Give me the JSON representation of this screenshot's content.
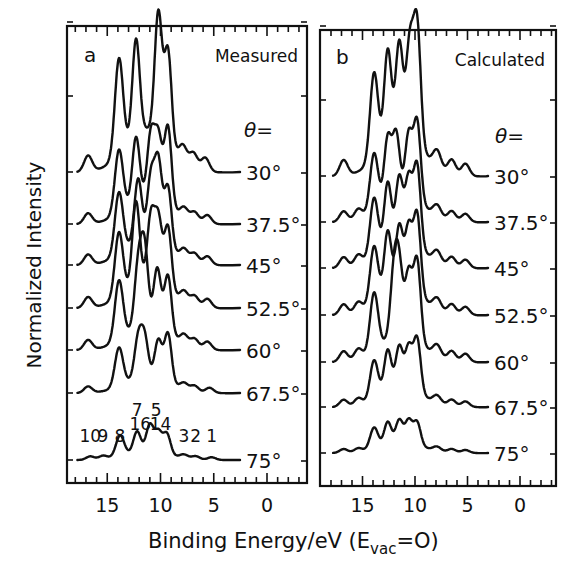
{
  "figure": {
    "ylabel": "Normalized Intensity",
    "xlabel_main": "Binding Energy/eV (E",
    "xlabel_sub": "vac",
    "xlabel_tail": "=O)",
    "theta_label": "θ="
  },
  "chart_data": {
    "type": "line",
    "xlabel": "Binding Energy/eV (E_vac=0)",
    "ylabel": "Normalized Intensity",
    "xlim": [
      18,
      -3
    ],
    "xticks": [
      15,
      10,
      5,
      0
    ],
    "xtick_labels": [
      "15",
      "10",
      "5",
      "0"
    ],
    "x_reversed": true,
    "grid": false,
    "offset_stacked": true,
    "angles": [
      "30°",
      "37.5°",
      "45°",
      "52.5°",
      "60°",
      "67.5°",
      "75°"
    ],
    "panels": [
      {
        "id": "a",
        "letter": "a",
        "title": "Measured",
        "peak_labels": [
          {
            "label": "10",
            "energy": 16.6
          },
          {
            "label": "9",
            "energy": 15.4
          },
          {
            "label": "8",
            "energy": 13.8
          },
          {
            "label": "7",
            "energy": 12.2
          },
          {
            "label": "16",
            "energy": 11.9
          },
          {
            "label": "5",
            "energy": 10.4
          },
          {
            "label": "14",
            "energy": 10.0
          },
          {
            "label": "3",
            "energy": 7.8
          },
          {
            "label": "2",
            "energy": 6.7
          },
          {
            "label": "1",
            "energy": 5.2
          }
        ],
        "series": [
          {
            "name": "30°",
            "peaks_eV": [
              16.8,
              13.9,
              12.3,
              10.2,
              9.3,
              7.9,
              6.9,
              5.8
            ],
            "max_peak_eV": 10.2
          },
          {
            "name": "37.5°",
            "peaks_eV": [
              16.8,
              13.9,
              12.3,
              10.9,
              10.2,
              9.3,
              7.8,
              6.8,
              5.6
            ],
            "max_peak_eV": 9.3
          },
          {
            "name": "45°",
            "peaks_eV": [
              16.8,
              13.9,
              12.1,
              10.9,
              10.2,
              9.3,
              7.8,
              6.8,
              5.6
            ],
            "max_peak_eV": 10.2
          },
          {
            "name": "52.5°",
            "peaks_eV": [
              16.8,
              13.9,
              12.3,
              10.9,
              10.2,
              9.3,
              7.8,
              6.8,
              5.6
            ],
            "max_peak_eV": 12.3
          },
          {
            "name": "60°",
            "peaks_eV": [
              16.8,
              13.9,
              12.1,
              11.5,
              10.3,
              9.3,
              7.8,
              6.8,
              5.6
            ],
            "max_peak_eV": 11.5
          },
          {
            "name": "67.5°",
            "peaks_eV": [
              16.8,
              13.9,
              12.1,
              11.5,
              10.2,
              9.3,
              7.8,
              6.8,
              5.4
            ],
            "max_peak_eV": 9.3
          },
          {
            "name": "75°",
            "peaks_eV": [
              16.6,
              15.4,
              13.8,
              12.2,
              11.0,
              10.2,
              9.4,
              7.8,
              6.7,
              5.2
            ],
            "max_peak_eV": 11.0
          }
        ]
      },
      {
        "id": "b",
        "letter": "b",
        "title": "Calculated",
        "series": [
          {
            "name": "30°",
            "peaks_eV": [
              16.8,
              13.9,
              12.6,
              11.5,
              10.5,
              9.8,
              7.9,
              6.5,
              5.2
            ],
            "max_peak_eV": 9.8
          },
          {
            "name": "37.5°",
            "peaks_eV": [
              16.8,
              15.4,
              13.9,
              12.6,
              11.8,
              10.6,
              9.8,
              7.9,
              6.5,
              5.2
            ],
            "max_peak_eV": 9.8
          },
          {
            "name": "45°",
            "peaks_eV": [
              16.8,
              15.4,
              13.9,
              12.6,
              11.5,
              10.6,
              9.8,
              7.9,
              6.5,
              5.2
            ],
            "max_peak_eV": 9.8
          },
          {
            "name": "52.5°",
            "peaks_eV": [
              16.8,
              15.4,
              13.9,
              12.6,
              11.5,
              10.6,
              9.8,
              7.9,
              6.5,
              5.2
            ],
            "max_peak_eV": 9.8
          },
          {
            "name": "60°",
            "peaks_eV": [
              16.8,
              15.4,
              13.9,
              12.0,
              11.5,
              10.6,
              9.8,
              7.9,
              6.5,
              5.2
            ],
            "max_peak_eV": 9.8
          },
          {
            "name": "67.5°",
            "peaks_eV": [
              16.8,
              15.4,
              13.9,
              12.6,
              11.5,
              10.6,
              9.8,
              7.9,
              6.5,
              5.2
            ],
            "max_peak_eV": 9.8
          },
          {
            "name": "75°",
            "peaks_eV": [
              16.8,
              15.4,
              13.9,
              12.6,
              11.5,
              10.6,
              9.8,
              7.9,
              6.5,
              5.2
            ],
            "max_peak_eV": 11.8
          }
        ]
      }
    ]
  }
}
